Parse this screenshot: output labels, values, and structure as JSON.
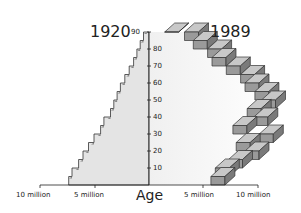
{
  "chart_data": {
    "type": "area",
    "subtype": "population-pyramid-half",
    "title": "",
    "series": [
      {
        "name": "1920",
        "side": "left",
        "age_groups": [
          0,
          5,
          10,
          15,
          20,
          25,
          30,
          35,
          40,
          45,
          50,
          55,
          60,
          65,
          70,
          75,
          80,
          85,
          90
        ],
        "values_millions": [
          7.3,
          7.0,
          6.4,
          6.0,
          5.5,
          5.0,
          4.4,
          4.1,
          3.5,
          3.2,
          2.9,
          2.6,
          2.2,
          1.8,
          1.4,
          1.1,
          0.8,
          0.5,
          0.2
        ],
        "fill": "#e4e4e4"
      },
      {
        "name": "1989",
        "side": "right",
        "age_groups": [
          0,
          5,
          10,
          15,
          20,
          25,
          30,
          35,
          40,
          45,
          50,
          55,
          60,
          65,
          70,
          75,
          80,
          85,
          90
        ],
        "values_millions": [
          6.9,
          7.3,
          8.5,
          10.0,
          9.2,
          11.3,
          8.9,
          10.8,
          10.2,
          11.5,
          10.9,
          10.0,
          9.6,
          8.3,
          7.0,
          6.6,
          5.3,
          4.5,
          2.7
        ],
        "fill": "#a8a8a8"
      }
    ],
    "xlabel": "",
    "ylabel": "Age",
    "y_ticks": [
      10,
      20,
      30,
      40,
      50,
      60,
      70,
      80,
      90
    ],
    "x_ticks_left": [
      "10 million",
      "5 million"
    ],
    "x_ticks_right": [
      "5 million",
      "10 million"
    ],
    "ylim": [
      0,
      90
    ],
    "xlim_millions": [
      -10,
      10
    ],
    "grid": false,
    "legend": "none"
  },
  "labels": {
    "year_left": "1920",
    "year_right": "1989",
    "axis_title": "Age",
    "left_10m": "10 million",
    "left_5m": "5 million",
    "right_5m": "5 million",
    "right_10m": "10 million",
    "ages": [
      "10",
      "20",
      "30",
      "40",
      "50",
      "60",
      "70",
      "80",
      "90"
    ]
  }
}
